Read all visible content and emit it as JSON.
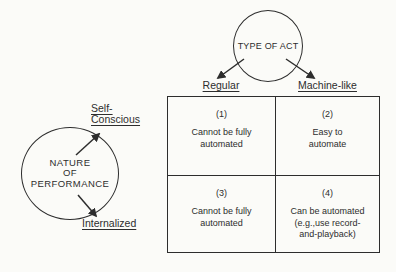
{
  "colors": {
    "background": "#fbfbf8",
    "ink": "#2d2d2d"
  },
  "top_circle": {
    "label": "TYPE OF ACT"
  },
  "left_circle": {
    "lines": [
      "NATURE",
      "OF",
      "PERFORMANCE"
    ]
  },
  "performance_labels": {
    "self_conscious": [
      "Self-",
      "Conscious"
    ],
    "internalized": "Internalized"
  },
  "matrix": {
    "col_headers": [
      "Regular",
      "Machine-like"
    ],
    "cells": [
      {
        "number": "(1)",
        "lines": [
          "Cannot be fully",
          "automated"
        ]
      },
      {
        "number": "(2)",
        "lines": [
          "Easy to",
          "automate"
        ]
      },
      {
        "number": "(3)",
        "lines": [
          "Cannot be fully",
          "automated"
        ]
      },
      {
        "number": "(4)",
        "lines": [
          "Can be automated",
          "(e.g.,use record-",
          "and-playback)"
        ]
      }
    ]
  }
}
